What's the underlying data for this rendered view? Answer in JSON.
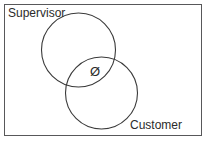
{
  "diagram": {
    "type": "venn",
    "title": "",
    "background_color": "#ffffff",
    "stroke_color": "#3a3a3a",
    "border_color": "#58585a",
    "text_color": "#2b2b2b",
    "sets": [
      {
        "id": "supervisor",
        "label": "Supervisor",
        "label_position": "top-left",
        "center_x": 78.5,
        "center_y": 50,
        "radius": 37
      },
      {
        "id": "customer",
        "label": "Customer",
        "label_position": "bottom-right",
        "center_x": 101.5,
        "center_y": 93,
        "radius": 36
      }
    ],
    "intersection": {
      "symbol": "Ø",
      "meaning": "empty-set",
      "center_x": 95,
      "center_y": 71
    }
  }
}
